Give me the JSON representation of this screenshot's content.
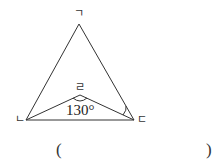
{
  "diagram": {
    "type": "geometry-triangle",
    "vertices": {
      "apex": {
        "label": "ㄱ",
        "x": 79,
        "y": 24
      },
      "bottom_left": {
        "label": "ㄴ",
        "x": 26,
        "y": 120
      },
      "bottom_right": {
        "label": "ㄷ",
        "x": 134,
        "y": 120
      },
      "inner": {
        "label": "ㄹ",
        "x": 80,
        "y": 95
      }
    },
    "angle_label": "130°",
    "answer_open": "(",
    "answer_close": ")",
    "line_color": "#333333"
  }
}
